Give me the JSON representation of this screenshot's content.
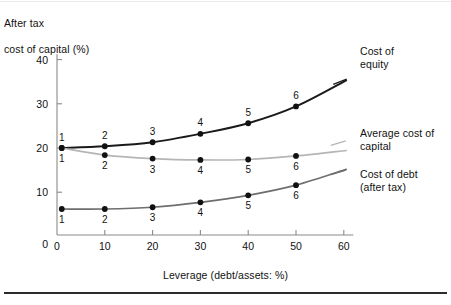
{
  "figure": {
    "y_axis_title_lines": [
      "After tax",
      "cost of capital (%)"
    ],
    "x_axis_title": "Leverage (debt/assets: %)"
  },
  "legend": {
    "equity": [
      "Cost of",
      "equity"
    ],
    "average": [
      "Average cost of",
      "capital"
    ],
    "debt": [
      "Cost of debt",
      "(after tax)"
    ]
  },
  "colors": {
    "cost_of_equity": "#1a1a1a",
    "average_cost_of_capital": "#b5b5b5",
    "cost_of_debt": "#6e6e6e",
    "axis": "#8a8a8a",
    "marker": "#111111",
    "bottom_rule": "#2b2b2b"
  },
  "chart_data": {
    "type": "line",
    "title": "",
    "xlabel": "Leverage (debt/assets: %)",
    "ylabel": "After tax cost of capital (%)",
    "xlim": [
      0,
      62
    ],
    "ylim": [
      0,
      42
    ],
    "xticks": [
      0,
      10,
      20,
      30,
      40,
      50,
      60
    ],
    "yticks": [
      0,
      10,
      20,
      30,
      40
    ],
    "xtick_labels": [
      "0",
      "10",
      "20",
      "30",
      "40",
      "50",
      "60"
    ],
    "ytick_labels": [
      "0",
      "10",
      "20",
      "30",
      "40"
    ],
    "grid": false,
    "legend_position": "right",
    "x": [
      1,
      10,
      20,
      30,
      40,
      50
    ],
    "point_labels": [
      "1",
      "2",
      "3",
      "4",
      "5",
      "6"
    ],
    "series": [
      {
        "name": "Cost of equity",
        "color": "#1a1a1a",
        "values": [
          20.0,
          20.4,
          21.3,
          23.2,
          25.6,
          29.4
        ],
        "label_position": "above"
      },
      {
        "name": "Average cost of capital",
        "color": "#b5b5b5",
        "values": [
          20.0,
          18.4,
          17.6,
          17.3,
          17.4,
          18.2
        ],
        "label_position": "below"
      },
      {
        "name": "Cost of debt (after tax)",
        "color": "#6e6e6e",
        "values": [
          6.2,
          6.2,
          6.6,
          7.7,
          9.3,
          11.6
        ],
        "label_position": "below"
      }
    ]
  }
}
